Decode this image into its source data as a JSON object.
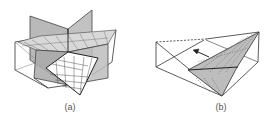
{
  "figure": {
    "panels": [
      {
        "id": "a",
        "caption": "(a)",
        "description": "Triangular prism sliced by intersecting vertical planes with a gridded diagonal plane"
      },
      {
        "id": "b",
        "caption": "(b)",
        "description": "Triangular prism with a shaded gridded diagonal plane and an arrow"
      }
    ],
    "colors": {
      "line": "#333333",
      "plane_shade": "#b8b8b8",
      "plane_shade_light": "#cfcfcf",
      "grid": "#555555",
      "caption": "#555555"
    }
  }
}
